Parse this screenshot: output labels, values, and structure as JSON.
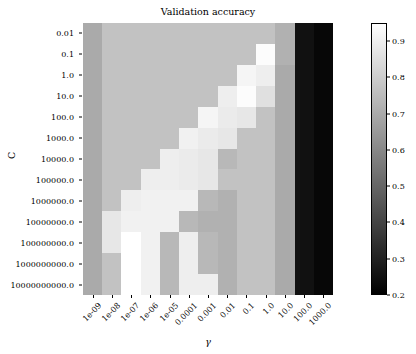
{
  "chart_data": {
    "type": "heatmap",
    "title": "Validation accuracy",
    "xlabel": "γ",
    "ylabel": "C",
    "colormap": "gray",
    "grid": false,
    "legend_position": "right-colorbar",
    "x_categories": [
      "1e-09",
      "1e-08",
      "1e-07",
      "1e-06",
      "1e-05",
      "0.0001",
      "0.001",
      "0.01",
      "0.1",
      "1.0",
      "10.0",
      "100.0",
      "1000.0"
    ],
    "y_categories": [
      "0.01",
      "0.1",
      "1.0",
      "10.0",
      "100.0",
      "1000.0",
      "10000.0",
      "100000.0",
      "1000000.0",
      "10000000.0",
      "100000000.0",
      "1000000000.0",
      "10000000000.0"
    ],
    "colorbar": {
      "ticks": [
        0.9,
        0.8,
        0.7,
        0.6,
        0.5,
        0.4,
        0.3,
        0.2
      ],
      "tick_labels": [
        "0.9",
        "0.8",
        "0.7",
        "0.6",
        "0.5",
        "0.4",
        "0.3",
        "0.2"
      ],
      "vmin": 0.2,
      "vmax": 0.95
    },
    "zlim": [
      0.2,
      0.95
    ],
    "values": [
      [
        0.7,
        0.77,
        0.77,
        0.77,
        0.77,
        0.77,
        0.77,
        0.77,
        0.77,
        0.77,
        0.72,
        0.25,
        0.22
      ],
      [
        0.7,
        0.77,
        0.77,
        0.77,
        0.77,
        0.77,
        0.77,
        0.77,
        0.77,
        0.94,
        0.72,
        0.25,
        0.22
      ],
      [
        0.7,
        0.77,
        0.77,
        0.77,
        0.77,
        0.77,
        0.77,
        0.77,
        0.92,
        0.9,
        0.7,
        0.25,
        0.22
      ],
      [
        0.7,
        0.77,
        0.77,
        0.77,
        0.77,
        0.77,
        0.77,
        0.9,
        0.94,
        0.86,
        0.7,
        0.25,
        0.22
      ],
      [
        0.7,
        0.77,
        0.77,
        0.77,
        0.77,
        0.77,
        0.92,
        0.89,
        0.88,
        0.77,
        0.7,
        0.25,
        0.22
      ],
      [
        0.7,
        0.77,
        0.77,
        0.77,
        0.77,
        0.91,
        0.89,
        0.88,
        0.77,
        0.77,
        0.7,
        0.25,
        0.22
      ],
      [
        0.7,
        0.77,
        0.77,
        0.77,
        0.9,
        0.89,
        0.88,
        0.74,
        0.77,
        0.77,
        0.7,
        0.25,
        0.22
      ],
      [
        0.7,
        0.77,
        0.77,
        0.9,
        0.9,
        0.89,
        0.88,
        0.77,
        0.77,
        0.77,
        0.7,
        0.25,
        0.22
      ],
      [
        0.7,
        0.77,
        0.9,
        0.91,
        0.91,
        0.91,
        0.74,
        0.72,
        0.77,
        0.77,
        0.7,
        0.25,
        0.22
      ],
      [
        0.7,
        0.88,
        0.91,
        0.91,
        0.91,
        0.74,
        0.72,
        0.72,
        0.77,
        0.77,
        0.7,
        0.25,
        0.22
      ],
      [
        0.7,
        0.88,
        0.95,
        0.91,
        0.74,
        0.9,
        0.74,
        0.72,
        0.77,
        0.77,
        0.7,
        0.25,
        0.22
      ],
      [
        0.7,
        0.77,
        0.95,
        0.91,
        0.74,
        0.9,
        0.74,
        0.72,
        0.77,
        0.77,
        0.7,
        0.25,
        0.22
      ],
      [
        0.7,
        0.77,
        0.95,
        0.91,
        0.74,
        0.9,
        0.9,
        0.72,
        0.77,
        0.77,
        0.7,
        0.25,
        0.22
      ]
    ]
  }
}
